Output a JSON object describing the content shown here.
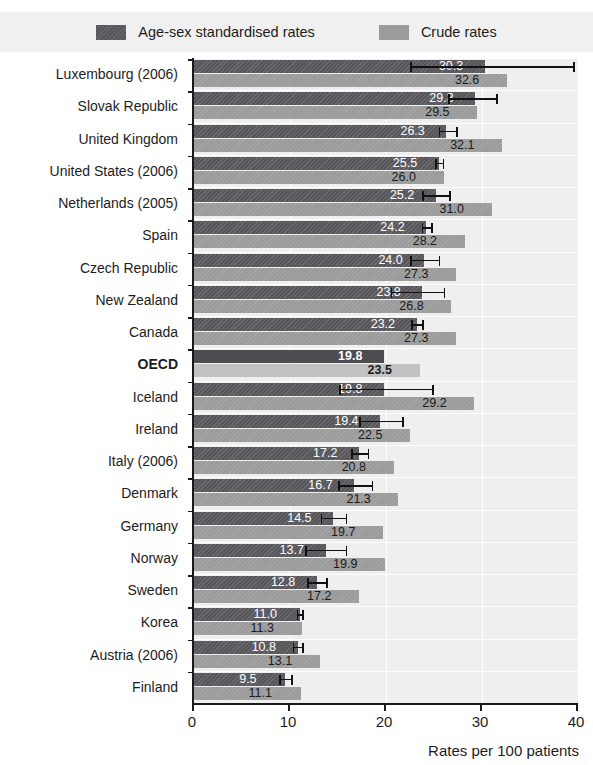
{
  "title_remnant": "",
  "legend": {
    "items": [
      {
        "label": "Age-sex standardised rates",
        "swatch": "dark-swatch-icon",
        "color": "#56565b"
      },
      {
        "label": "Crude rates",
        "swatch": "light-swatch-icon",
        "color": "#9b9b9b"
      }
    ]
  },
  "axis": {
    "x_title": "Rates per 100 patients",
    "x_ticks": [
      "0",
      "10",
      "20",
      "30",
      "40"
    ]
  },
  "chart_data": {
    "type": "bar",
    "title": "",
    "subtitle": "",
    "xlabel": "Rates per 100 patients",
    "ylabel": "",
    "xlim": [
      0,
      40
    ],
    "orientation": "horizontal",
    "grid": true,
    "legend_position": "top",
    "categories": [
      "Luxembourg (2006)",
      "Slovak Republic",
      "United Kingdom",
      "United States (2006)",
      "Netherlands (2005)",
      "Spain",
      "Czech Republic",
      "New Zealand",
      "Canada",
      "OECD",
      "Iceland",
      "Ireland",
      "Italy (2006)",
      "Denmark",
      "Germany",
      "Norway",
      "Sweden",
      "Korea",
      "Austria (2006)",
      "Finland"
    ],
    "highlight_category": "OECD",
    "series": [
      {
        "name": "Age-sex standardised rates",
        "color": "#56565b",
        "values": [
          30.3,
          29.3,
          26.3,
          25.5,
          25.2,
          24.2,
          24.0,
          23.8,
          23.2,
          19.8,
          19.8,
          19.4,
          17.2,
          16.7,
          14.5,
          13.7,
          12.8,
          11.0,
          10.8,
          9.5
        ],
        "error_bars": [
          {
            "low": 22.5,
            "high": 39.5
          },
          {
            "low": 26.5,
            "high": 31.5
          },
          {
            "low": 25.5,
            "high": 27.3
          },
          {
            "low": 25.1,
            "high": 25.9
          },
          {
            "low": 23.8,
            "high": 26.6
          },
          {
            "low": 23.7,
            "high": 24.7
          },
          {
            "low": 22.5,
            "high": 25.5
          },
          {
            "low": 20.5,
            "high": 26.0
          },
          {
            "low": 22.6,
            "high": 23.8
          },
          {
            "low": null,
            "high": null
          },
          {
            "low": 15.1,
            "high": 24.8
          },
          {
            "low": 17.2,
            "high": 21.7
          },
          {
            "low": 16.4,
            "high": 18.1
          },
          {
            "low": 15.0,
            "high": 18.5
          },
          {
            "low": 13.2,
            "high": 15.8
          },
          {
            "low": 11.6,
            "high": 15.8
          },
          {
            "low": 11.8,
            "high": 13.8
          },
          {
            "low": 10.7,
            "high": 11.3
          },
          {
            "low": 10.3,
            "high": 11.3
          },
          {
            "low": 8.9,
            "high": 10.1
          }
        ]
      },
      {
        "name": "Crude rates",
        "color": "#9b9b9b",
        "values": [
          32.6,
          29.5,
          32.1,
          26.0,
          31.0,
          28.2,
          27.3,
          26.8,
          27.3,
          23.5,
          29.2,
          22.5,
          20.8,
          21.3,
          19.7,
          19.9,
          17.2,
          11.3,
          13.1,
          11.1
        ],
        "error_bars": []
      }
    ]
  }
}
